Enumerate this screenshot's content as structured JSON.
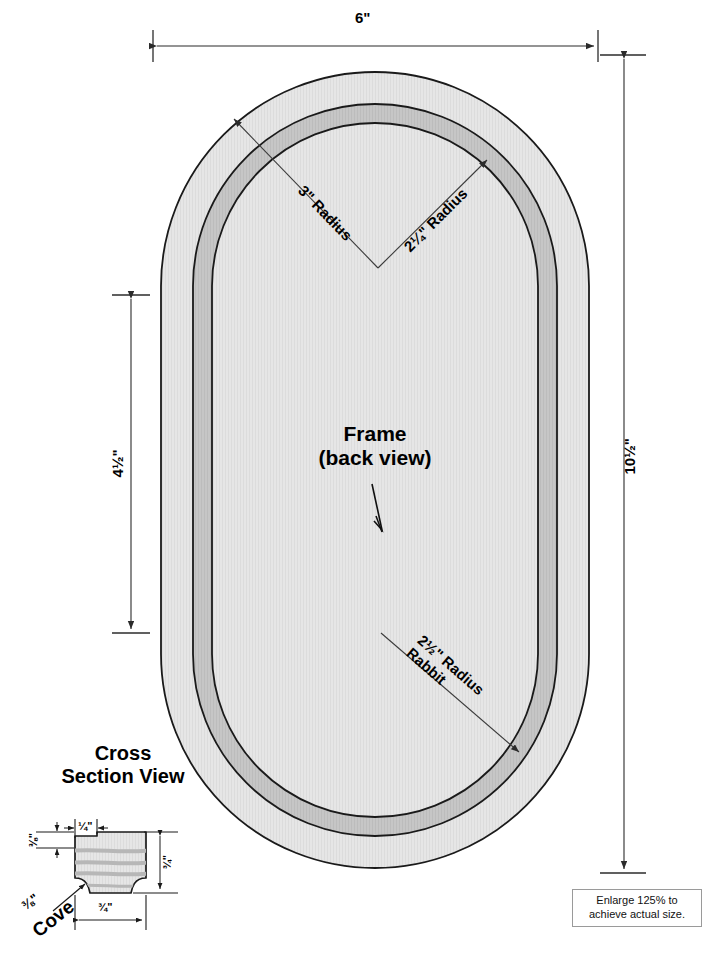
{
  "drawing": {
    "title": "Oval Picture Frame Plan",
    "center_label_line1": "Frame",
    "center_label_line2": "(back view)",
    "colors": {
      "frame_body": "#e3e3e3",
      "rabbet_band": "#c2c2c2",
      "inner_opening": "#e9e9e9",
      "outline": "#1a1a1a",
      "dimension_line": "#3b3b3b",
      "note_border": "#9a9a9a"
    }
  },
  "dimensions": {
    "overall_width": "6\"",
    "overall_height": "10½\"",
    "inner_height": "4½\"",
    "radius_outer": "3\" Radius",
    "radius_inner": "2¼\" Radius",
    "radius_rabbet_line1": "2½\" Radius",
    "radius_rabbet_line2": "Rabbit"
  },
  "cross_section": {
    "title_line1": "Cross",
    "title_line2": "Section View",
    "rabbet_width": "¼\"",
    "rabbet_depth": "⅜\"",
    "stock_thickness": "¾\"",
    "stock_width": "¾\"",
    "cove_label_size": "⅜\"",
    "cove_label_name": "Cove"
  },
  "note": {
    "text": "Enlarge 125% to achieve actual size."
  }
}
